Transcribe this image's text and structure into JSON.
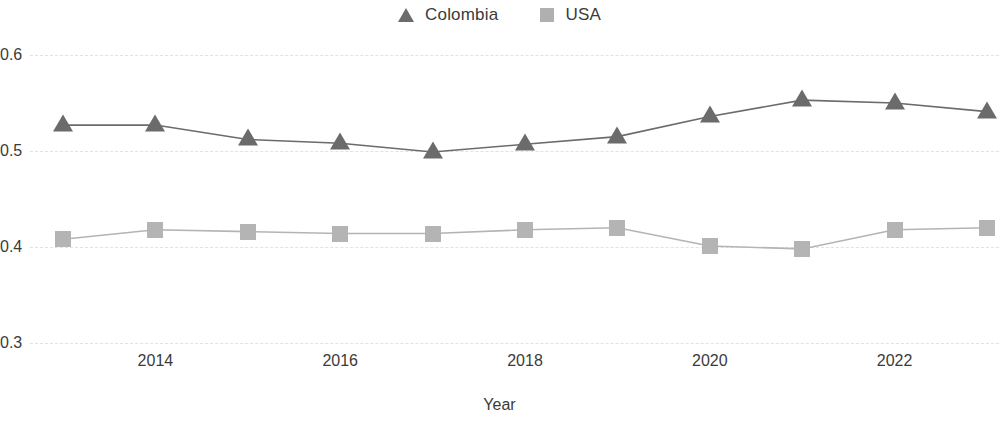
{
  "legend": {
    "position": "top-center",
    "entries": [
      {
        "label": "Colombia",
        "marker": "triangle-marker-icon",
        "color": "#6b6b6b"
      },
      {
        "label": "USA",
        "marker": "square-marker-icon",
        "color": "#b4b4b4"
      }
    ]
  },
  "axes": {
    "x_title": "Year",
    "y_ticks": [
      "0.6",
      "0.5",
      "0.4",
      "0.3"
    ],
    "x_ticks": [
      "2014",
      "2016",
      "2018",
      "2020",
      "2022"
    ]
  },
  "chart_data": {
    "type": "line",
    "title": "",
    "xlabel": "Year",
    "ylabel": "",
    "x": [
      2013,
      2014,
      2015,
      2016,
      2017,
      2018,
      2019,
      2020,
      2021,
      2022,
      2023
    ],
    "xlim": [
      2013,
      2023
    ],
    "ylim": [
      0.3,
      0.6
    ],
    "yticks": [
      0.3,
      0.4,
      0.5,
      0.6
    ],
    "xticks": [
      2014,
      2016,
      2018,
      2020,
      2022
    ],
    "grid": true,
    "grid_axis": "y",
    "legend_position": "top-center",
    "series": [
      {
        "name": "Colombia",
        "marker": "triangle",
        "color": "#6b6b6b",
        "values": [
          0.527,
          0.527,
          0.512,
          0.508,
          0.499,
          0.507,
          0.515,
          0.536,
          0.553,
          0.55,
          0.541
        ]
      },
      {
        "name": "USA",
        "marker": "square",
        "color": "#b4b4b4",
        "values": [
          0.408,
          0.418,
          0.416,
          0.414,
          0.414,
          0.418,
          0.42,
          0.401,
          0.398,
          0.418,
          0.42
        ]
      }
    ]
  }
}
